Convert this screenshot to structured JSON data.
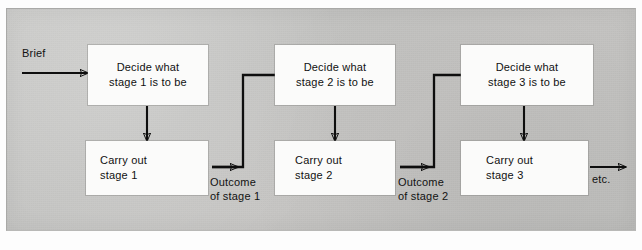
{
  "figure": {
    "type": "process-flow-diagram",
    "width": 642,
    "height": 250,
    "background_color": "#c6c6c4",
    "box_fill_color": "#fbfbfa",
    "line_color": "#0e0e0e"
  },
  "nodes": [
    {
      "id": "decide1",
      "text": "Decide what\nstage 1 is to be",
      "x": 88,
      "y": 45,
      "w": 120,
      "h": 60
    },
    {
      "id": "carry1",
      "text": "Carry out\nstage 1",
      "x": 86,
      "y": 141,
      "w": 122,
      "h": 54
    },
    {
      "id": "decide2",
      "text": "Decide what\nstage 2 is to be",
      "x": 275,
      "y": 45,
      "w": 120,
      "h": 60
    },
    {
      "id": "carry2",
      "text": "Carry out\nstage 2",
      "x": 275,
      "y": 141,
      "w": 120,
      "h": 54
    },
    {
      "id": "decide3",
      "text": "Decide what\nstage 3 is to be",
      "x": 461,
      "y": 45,
      "w": 132,
      "h": 60
    },
    {
      "id": "carry3",
      "text": "Carry out\nstage 3",
      "x": 461,
      "y": 141,
      "w": 127,
      "h": 54
    }
  ],
  "labels": [
    {
      "id": "brief",
      "text": "Brief",
      "x": 22,
      "y": 46
    },
    {
      "id": "outcome1",
      "text": "Outcome\nof stage 1",
      "x": 210,
      "y": 175
    },
    {
      "id": "outcome2",
      "text": "Outcome\nof stage 2",
      "x": 398,
      "y": 175
    },
    {
      "id": "etc",
      "text": "etc.",
      "x": 592,
      "y": 172
    }
  ],
  "connectors": [
    {
      "id": "brief-to-decide1",
      "from": "brief",
      "to": "decide1",
      "kind": "arrow-right"
    },
    {
      "id": "decide1-to-carry1",
      "from": "decide1",
      "to": "carry1",
      "kind": "arrow-down"
    },
    {
      "id": "carry1-to-decide2",
      "from": "carry1",
      "to": "decide2",
      "kind": "elbow-up-right",
      "label": "Outcome of stage 1"
    },
    {
      "id": "decide2-to-carry2",
      "from": "decide2",
      "to": "carry2",
      "kind": "arrow-down"
    },
    {
      "id": "carry2-to-decide3",
      "from": "carry2",
      "to": "decide3",
      "kind": "elbow-up-right",
      "label": "Outcome of stage 2"
    },
    {
      "id": "decide3-to-carry3",
      "from": "decide3",
      "to": "carry3",
      "kind": "arrow-down"
    },
    {
      "id": "carry3-to-etc",
      "from": "carry3",
      "to": "etc",
      "kind": "arrow-right"
    }
  ]
}
